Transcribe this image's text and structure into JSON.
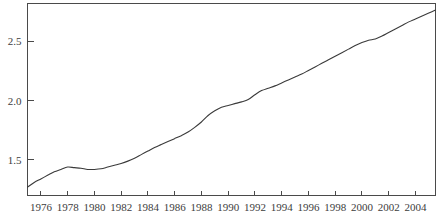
{
  "chart_data": {
    "type": "line",
    "title": "",
    "subtitle": "",
    "xlabel": "",
    "ylabel": "",
    "xlim": [
      1975.0,
      2005.5
    ],
    "ylim": [
      1.2,
      2.82
    ],
    "grid": false,
    "legend": null,
    "axis_box": "left-bottom-top-right closed frame",
    "xticks": [
      1976,
      1978,
      1980,
      1982,
      1984,
      1986,
      1988,
      1990,
      1992,
      1994,
      1996,
      1998,
      2000,
      2002,
      2004
    ],
    "xtick_labels": [
      "1976",
      "1978",
      "1980",
      "1982",
      "1984",
      "1986",
      "1988",
      "1990",
      "1992",
      "1994",
      "1996",
      "1998",
      "2000",
      "2002",
      "2004"
    ],
    "yticks": [
      1.5,
      2.0,
      2.5
    ],
    "ytick_labels": [
      "1.5",
      "2.0",
      "2.5"
    ],
    "series": [
      {
        "name": "series-1",
        "color": "#3a3a3a",
        "x": [
          1975.0,
          1975.5,
          1976.0,
          1976.5,
          1977.0,
          1977.5,
          1978.0,
          1978.5,
          1979.0,
          1979.5,
          1980.0,
          1980.5,
          1981.0,
          1981.5,
          1982.0,
          1982.5,
          1983.0,
          1983.5,
          1984.0,
          1984.5,
          1985.0,
          1985.5,
          1986.0,
          1986.5,
          1987.0,
          1987.5,
          1988.0,
          1988.5,
          1989.0,
          1989.5,
          1990.0,
          1990.5,
          1991.0,
          1991.5,
          1992.0,
          1992.5,
          1993.0,
          1993.5,
          1994.0,
          1994.5,
          1995.0,
          1995.5,
          1996.0,
          1996.5,
          1997.0,
          1997.5,
          1998.0,
          1998.5,
          1999.0,
          1999.5,
          2000.0,
          2000.5,
          2001.0,
          2001.5,
          2002.0,
          2002.5,
          2003.0,
          2003.5,
          2004.0,
          2004.5,
          2005.0,
          2005.5
        ],
        "y": [
          1.27,
          1.31,
          1.34,
          1.37,
          1.4,
          1.42,
          1.44,
          1.435,
          1.43,
          1.42,
          1.42,
          1.425,
          1.44,
          1.455,
          1.47,
          1.49,
          1.515,
          1.545,
          1.575,
          1.605,
          1.63,
          1.655,
          1.68,
          1.705,
          1.735,
          1.775,
          1.82,
          1.875,
          1.915,
          1.945,
          1.96,
          1.975,
          1.99,
          2.01,
          2.05,
          2.085,
          2.105,
          2.125,
          2.15,
          2.175,
          2.2,
          2.225,
          2.255,
          2.285,
          2.315,
          2.345,
          2.375,
          2.405,
          2.435,
          2.465,
          2.49,
          2.51,
          2.52,
          2.545,
          2.575,
          2.605,
          2.635,
          2.665,
          2.69,
          2.715,
          2.74,
          2.765
        ]
      }
    ]
  },
  "style": {
    "axis_color": "#4a4a4a",
    "line_color": "#3a3a3a",
    "label_color": "#3d3d3d",
    "background": "#ffffff"
  }
}
